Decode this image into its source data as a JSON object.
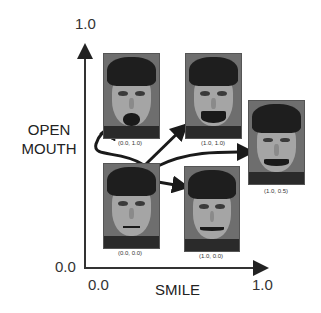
{
  "figure": {
    "y_axis": {
      "title_line1": "OPEN",
      "title_line2": "MOUTH",
      "tick_min": "0.0",
      "tick_max": "1.0"
    },
    "x_axis": {
      "title": "SMILE",
      "tick_min": "0.0",
      "tick_max": "1.0"
    },
    "faces": [
      {
        "id": "neutral",
        "label": "(0.0, 0.0)",
        "smile": 0.0,
        "open_mouth": 0.0
      },
      {
        "id": "open-mouth",
        "label": "(0.0, 1.0)",
        "smile": 0.0,
        "open_mouth": 1.0
      },
      {
        "id": "smile-open",
        "label": "(1.0, 1.0)",
        "smile": 1.0,
        "open_mouth": 1.0
      },
      {
        "id": "smile-half-open",
        "label": "(1.0, 0.5)",
        "smile": 1.0,
        "open_mouth": 0.5
      },
      {
        "id": "smile-closed",
        "label": "(1.0, 0.0)",
        "smile": 1.0,
        "open_mouth": 0.0
      }
    ],
    "arrows": [
      {
        "from": "(0.0, 0.0)",
        "to": "(0.0, 1.0)"
      },
      {
        "from": "(0.0, 0.0)",
        "to": "(1.0, 1.0)"
      },
      {
        "from": "(0.0, 0.0)",
        "to": "(1.0, 0.5)"
      },
      {
        "from": "(0.0, 0.0)",
        "to": "(1.0, 0.0)"
      }
    ],
    "colors": {
      "axis": "#333333",
      "arrow": "#1a1a1a",
      "background": "#ffffff"
    }
  }
}
